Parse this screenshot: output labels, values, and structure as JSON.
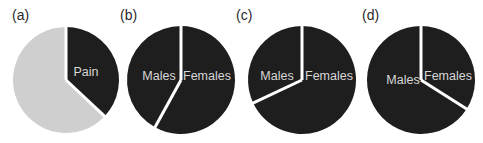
{
  "colors": {
    "dark": "#1e1e1e",
    "light": "#cfcfcf",
    "separator": "#ffffff",
    "label_text": "#d8d8d8"
  },
  "chart_data": [
    {
      "type": "pie",
      "panel": "(a)",
      "slices": [
        {
          "label": "Pain",
          "value": 37,
          "color": "#1e1e1e"
        },
        {
          "label": "",
          "value": 63,
          "color": "#cfcfcf"
        }
      ],
      "start_angle": "12 o'clock, clockwise"
    },
    {
      "type": "pie",
      "panel": "(b)",
      "slices": [
        {
          "label": "Females",
          "value": 58,
          "color": "#1e1e1e"
        },
        {
          "label": "Males",
          "value": 42,
          "color": "#1e1e1e"
        }
      ],
      "start_angle": "12 o'clock, clockwise"
    },
    {
      "type": "pie",
      "panel": "(c)",
      "slices": [
        {
          "label": "Females",
          "value": 68,
          "color": "#1e1e1e"
        },
        {
          "label": "Males",
          "value": 32,
          "color": "#1e1e1e"
        }
      ],
      "start_angle": "12 o'clock, clockwise"
    },
    {
      "type": "pie",
      "panel": "(d)",
      "slices": [
        {
          "label": "Females",
          "value": 34,
          "color": "#1e1e1e"
        },
        {
          "label": "Males",
          "value": 66,
          "color": "#1e1e1e"
        }
      ],
      "start_angle": "12 o'clock, clockwise"
    }
  ],
  "panels": [
    {
      "id": "a",
      "label": "(a)"
    },
    {
      "id": "b",
      "label": "(b)"
    },
    {
      "id": "c",
      "label": "(c)"
    },
    {
      "id": "d",
      "label": "(d)"
    }
  ]
}
